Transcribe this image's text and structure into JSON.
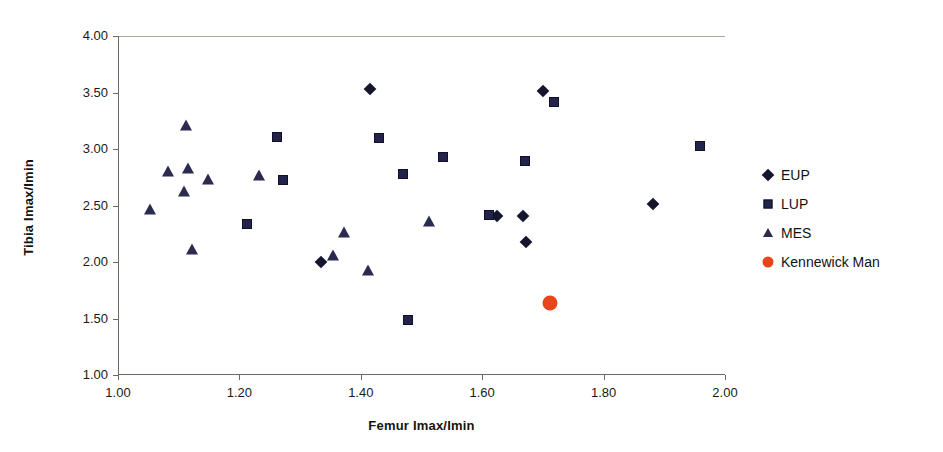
{
  "chart_data": {
    "type": "scatter",
    "title": "",
    "xlabel": "Femur Imax/Imin",
    "ylabel": "Tibia Imax/Imin",
    "xlim": [
      1.0,
      2.0
    ],
    "ylim": [
      1.0,
      4.0
    ],
    "xticks": [
      "1.00",
      "1.20",
      "1.40",
      "1.60",
      "1.80",
      "2.00"
    ],
    "yticks": [
      "1.00",
      "1.50",
      "2.00",
      "2.50",
      "3.00",
      "3.50",
      "4.00"
    ],
    "xtick_values": [
      1.0,
      1.2,
      1.4,
      1.6,
      1.8,
      2.0
    ],
    "ytick_values": [
      1.0,
      1.5,
      2.0,
      2.5,
      3.0,
      3.5,
      4.0
    ],
    "grid": false,
    "legend_position": "right",
    "series": [
      {
        "name": "EUP",
        "marker": "diamond",
        "color": "#15152e",
        "points": [
          [
            1.415,
            3.53
          ],
          [
            1.335,
            2.0
          ],
          [
            1.7,
            3.51
          ],
          [
            1.625,
            2.41
          ],
          [
            1.668,
            2.41
          ],
          [
            1.672,
            2.18
          ],
          [
            1.882,
            2.51
          ]
        ]
      },
      {
        "name": "LUP",
        "marker": "square",
        "color": "#24244a",
        "points": [
          [
            1.212,
            2.34
          ],
          [
            1.262,
            3.11
          ],
          [
            1.272,
            2.73
          ],
          [
            1.43,
            3.1
          ],
          [
            1.47,
            2.78
          ],
          [
            1.478,
            1.49
          ],
          [
            1.535,
            2.93
          ],
          [
            1.612,
            2.42
          ],
          [
            1.67,
            2.89
          ],
          [
            1.718,
            3.42
          ],
          [
            1.958,
            3.03
          ]
        ]
      },
      {
        "name": "MES",
        "marker": "triangle",
        "color": "#2b2b4f",
        "points": [
          [
            1.052,
            2.46
          ],
          [
            1.082,
            2.8
          ],
          [
            1.108,
            2.62
          ],
          [
            1.112,
            3.2
          ],
          [
            1.115,
            2.82
          ],
          [
            1.122,
            2.11
          ],
          [
            1.148,
            2.73
          ],
          [
            1.232,
            2.76
          ],
          [
            1.355,
            2.05
          ],
          [
            1.372,
            2.26
          ],
          [
            1.412,
            1.92
          ],
          [
            1.512,
            2.35
          ]
        ]
      },
      {
        "name": "Kennewick Man",
        "marker": "circle",
        "color": "#e8451a",
        "points": [
          [
            1.712,
            1.64
          ]
        ]
      }
    ]
  },
  "legend": {
    "items": [
      {
        "label": "EUP",
        "marker": "diamond-icon"
      },
      {
        "label": "LUP",
        "marker": "square-icon"
      },
      {
        "label": "MES",
        "marker": "triangle-icon"
      },
      {
        "label": "Kennewick Man",
        "marker": "circle-icon"
      }
    ]
  }
}
